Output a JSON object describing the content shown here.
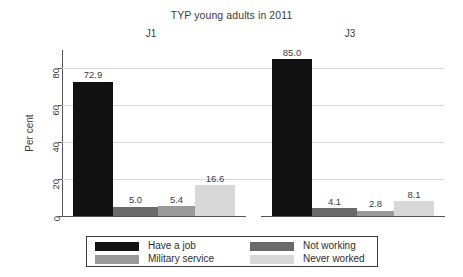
{
  "chart_data": {
    "type": "bar",
    "title": "TYP young adults in 2011",
    "xlabel": "",
    "ylabel": "Per cent",
    "ylim": [
      0,
      90
    ],
    "yticks": [
      0,
      20,
      40,
      60,
      80
    ],
    "ytick_labels": [
      "0",
      "20",
      "40",
      "60",
      "80"
    ],
    "grid": true,
    "legend_position": "bottom",
    "categories": [
      "J1",
      "J3"
    ],
    "series": [
      {
        "name": "Have a job",
        "color": "#111111",
        "values": [
          72.9,
          85.0
        ],
        "labels": [
          "72.9",
          "85.0"
        ]
      },
      {
        "name": "Not working",
        "color": "#6a6a6a",
        "values": [
          5.0,
          4.1
        ],
        "labels": [
          "5.0",
          "4.1"
        ]
      },
      {
        "name": "Military service",
        "color": "#9a9a9a",
        "values": [
          5.4,
          2.8
        ],
        "labels": [
          "5.4",
          "2.8"
        ]
      },
      {
        "name": "Never worked",
        "color": "#d8d8d8",
        "values": [
          16.6,
          8.1
        ],
        "labels": [
          "16.6",
          "8.1"
        ]
      }
    ],
    "legend": [
      {
        "label": "Have a job",
        "color": "#111111"
      },
      {
        "label": "Not working",
        "color": "#6a6a6a"
      },
      {
        "label": "Military service",
        "color": "#9a9a9a"
      },
      {
        "label": "Never worked",
        "color": "#d8d8d8"
      }
    ],
    "colors": {
      "have_a_job": "#111111",
      "not_working": "#6a6a6a",
      "military_service": "#9a9a9a",
      "never_worked": "#d8d8d8",
      "gridline": "#d7d7d7",
      "axis": "#555555",
      "text": "#3c3c3c",
      "background": "#ffffff"
    }
  }
}
